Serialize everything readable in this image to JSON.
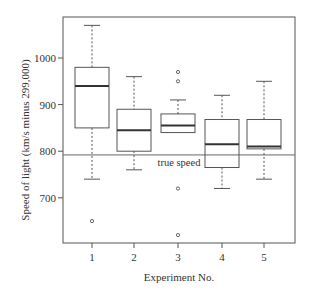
{
  "chart_data": {
    "type": "box",
    "title": "",
    "xlabel": "Experiment No.",
    "ylabel": "Speed of light (km/s minus 299,000)",
    "categories": [
      "1",
      "2",
      "3",
      "4",
      "5"
    ],
    "yticks": [
      700,
      800,
      900,
      1000
    ],
    "ylim": [
      603,
      1088
    ],
    "grid": false,
    "series": [
      {
        "name": "1",
        "whisker_low": 740,
        "q1": 850,
        "median": 940,
        "q3": 980,
        "whisker_high": 1070,
        "outliers": [
          650
        ]
      },
      {
        "name": "2",
        "whisker_low": 760,
        "q1": 800,
        "median": 845,
        "q3": 890,
        "whisker_high": 960,
        "outliers": []
      },
      {
        "name": "3",
        "whisker_low": 840,
        "q1": 840,
        "median": 855,
        "q3": 880,
        "whisker_high": 910,
        "outliers": [
          970,
          950,
          720,
          620
        ]
      },
      {
        "name": "4",
        "whisker_low": 720,
        "q1": 765,
        "median": 815,
        "q3": 868,
        "whisker_high": 920,
        "outliers": []
      },
      {
        "name": "5",
        "whisker_low": 740,
        "q1": 805,
        "median": 810,
        "q3": 868,
        "whisker_high": 950,
        "outliers": []
      }
    ],
    "annotations": [
      {
        "type": "hline",
        "y": 792,
        "label": "true speed"
      }
    ]
  },
  "labels": {
    "xlabel": "Experiment No.",
    "ylabel": "Speed of light (km/s minus 299,000)",
    "reference_line": "true speed"
  }
}
